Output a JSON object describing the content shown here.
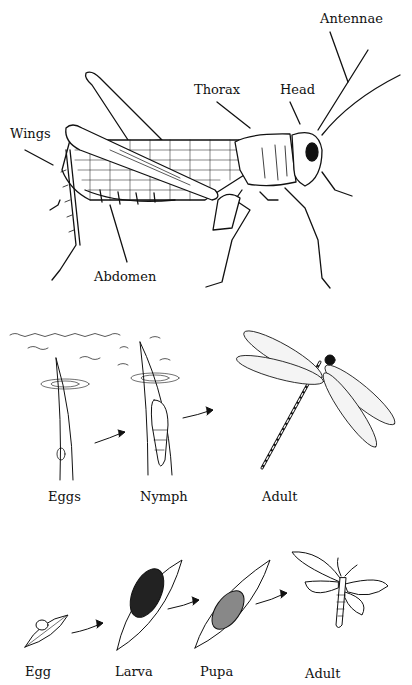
{
  "grasshopper": {
    "labels": {
      "antennae": "Antennae",
      "thorax": "Thorax",
      "head": "Head",
      "wings": "Wings",
      "abdomen": "Abdomen"
    }
  },
  "incomplete_metamorphosis": {
    "organism": "dragonfly",
    "stages": [
      "Eggs",
      "Nymph",
      "Adult"
    ]
  },
  "complete_metamorphosis": {
    "organism": "moth",
    "stages": [
      "Egg",
      "Larva",
      "Pupa",
      "Adult"
    ]
  }
}
